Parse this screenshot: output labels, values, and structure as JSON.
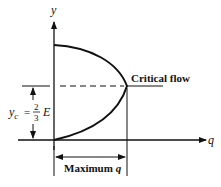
{
  "diagram": {
    "axis_y_label": "y",
    "axis_x_label": "q",
    "critical_flow_label": "Critical flow",
    "yc_label": {
      "symbol": "y",
      "subscript": "c",
      "equals": "=",
      "numerator": "2",
      "denominator": "3",
      "variable": "E"
    },
    "max_q_label": {
      "text": "Maximum ",
      "var": "q"
    },
    "colors": {
      "line": "#111111",
      "background": "#ffffff"
    }
  }
}
